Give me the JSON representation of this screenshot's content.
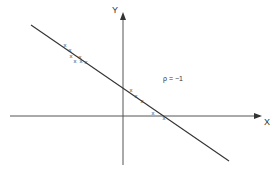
{
  "diagram": {
    "axes": {
      "x_label": "X",
      "y_label": "Y"
    },
    "annotation": "ρ = −1",
    "fit_line": {
      "from": [
        31,
        25
      ],
      "to": [
        229,
        161
      ]
    },
    "points": [
      {
        "x": 65,
        "y": 45,
        "mark": "x"
      },
      {
        "x": 70,
        "y": 50,
        "mark": "x"
      },
      {
        "x": 71,
        "y": 56,
        "mark": "x"
      },
      {
        "x": 75,
        "y": 61,
        "mark": "x"
      },
      {
        "x": 80,
        "y": 57,
        "mark": "x"
      },
      {
        "x": 81,
        "y": 61,
        "mark": "x"
      },
      {
        "x": 86,
        "y": 62,
        "mark": "x"
      },
      {
        "x": 131,
        "y": 90,
        "mark": "x"
      },
      {
        "x": 136,
        "y": 96,
        "mark": "x"
      },
      {
        "x": 142,
        "y": 101,
        "mark": "x"
      },
      {
        "x": 153,
        "y": 113,
        "mark": "x"
      },
      {
        "x": 164,
        "y": 118,
        "mark": "x"
      }
    ],
    "colors": {
      "ink": "#333333",
      "background": "#ffffff"
    }
  }
}
